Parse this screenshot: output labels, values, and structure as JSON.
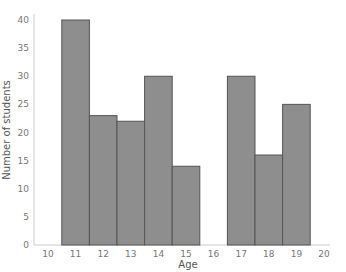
{
  "chart_data": {
    "type": "bar",
    "title": "",
    "xlabel": "Age",
    "ylabel": "Number of students",
    "x_ticks": [
      "10",
      "11",
      "12",
      "13",
      "14",
      "15",
      "16",
      "17",
      "18",
      "19",
      "20"
    ],
    "categories": [
      "11",
      "12",
      "13",
      "14",
      "15",
      "17",
      "18",
      "19"
    ],
    "values": [
      40,
      23,
      22,
      30,
      14,
      30,
      16,
      25
    ],
    "y_ticks": [
      0,
      5,
      10,
      15,
      20,
      25,
      30,
      35,
      40
    ],
    "ylim": [
      0,
      40
    ],
    "xlim": [
      10,
      20
    ],
    "grid": false,
    "legend": "none",
    "bar_color": "#8e8e8e",
    "bar_edge_color": "#555555"
  }
}
